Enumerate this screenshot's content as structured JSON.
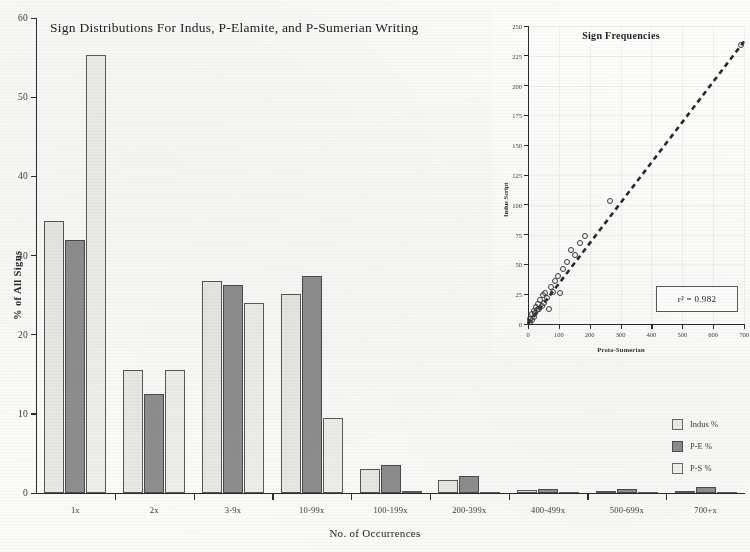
{
  "chart_data": [
    {
      "type": "bar",
      "id": "main",
      "title": "Sign Distributions For Indus, P-Elamite, and P-Sumerian Writing",
      "xlabel": "No. of Occurrences",
      "ylabel": "% of All Signs",
      "ylim": [
        0,
        60
      ],
      "yticks": [
        0,
        10,
        20,
        30,
        40,
        50,
        60
      ],
      "grid": false,
      "legend_position": "right",
      "categories": [
        "1x",
        "2x",
        "3-9x",
        "10-99x",
        "100-199x",
        "200-399x",
        "400-499x",
        "500-699x",
        "700+x"
      ],
      "series": [
        {
          "name": "Indus %",
          "color": "#e9e9e4",
          "values": [
            34.3,
            15.6,
            26.8,
            25.2,
            3.0,
            1.7,
            0.35,
            0.2,
            0.25
          ]
        },
        {
          "name": "P-E %",
          "color": "#8e8e8e",
          "values": [
            32.0,
            12.5,
            26.3,
            27.4,
            3.6,
            2.1,
            0.55,
            0.5,
            0.8
          ]
        },
        {
          "name": "P-S %",
          "color": "#efefea",
          "values": [
            55.3,
            15.6,
            24.0,
            9.5,
            0.25,
            0.1,
            0.05,
            0.05,
            0.05
          ]
        }
      ]
    },
    {
      "type": "scatter",
      "id": "inset",
      "title": "Sign Frequencies",
      "xlabel": "Proto-Sumerian",
      "ylabel": "Indus Script",
      "xlim": [
        0,
        700
      ],
      "ylim": [
        0,
        250
      ],
      "xticks": [
        0,
        100,
        200,
        300,
        400,
        500,
        600,
        700
      ],
      "yticks": [
        0,
        25,
        50,
        75,
        100,
        125,
        150,
        175,
        200,
        225,
        250
      ],
      "grid": true,
      "annotation": "r² = 0.982",
      "annotation_value": 0.982,
      "trendline": {
        "style": "dashed",
        "x": [
          0,
          700
        ],
        "y": [
          0,
          237
        ]
      },
      "points": [
        {
          "x": 5,
          "y": 2
        },
        {
          "x": 8,
          "y": 4
        },
        {
          "x": 12,
          "y": 3
        },
        {
          "x": 14,
          "y": 8
        },
        {
          "x": 18,
          "y": 6
        },
        {
          "x": 20,
          "y": 11
        },
        {
          "x": 24,
          "y": 9
        },
        {
          "x": 26,
          "y": 14
        },
        {
          "x": 30,
          "y": 12
        },
        {
          "x": 33,
          "y": 17
        },
        {
          "x": 37,
          "y": 13
        },
        {
          "x": 40,
          "y": 20
        },
        {
          "x": 44,
          "y": 15
        },
        {
          "x": 48,
          "y": 24
        },
        {
          "x": 52,
          "y": 18
        },
        {
          "x": 56,
          "y": 26
        },
        {
          "x": 62,
          "y": 22
        },
        {
          "x": 68,
          "y": 13
        },
        {
          "x": 74,
          "y": 31
        },
        {
          "x": 80,
          "y": 27
        },
        {
          "x": 88,
          "y": 36
        },
        {
          "x": 96,
          "y": 40
        },
        {
          "x": 104,
          "y": 26
        },
        {
          "x": 112,
          "y": 46
        },
        {
          "x": 126,
          "y": 52
        },
        {
          "x": 140,
          "y": 62
        },
        {
          "x": 152,
          "y": 58
        },
        {
          "x": 168,
          "y": 68
        },
        {
          "x": 186,
          "y": 74
        },
        {
          "x": 266,
          "y": 103
        },
        {
          "x": 690,
          "y": 234
        }
      ]
    }
  ]
}
